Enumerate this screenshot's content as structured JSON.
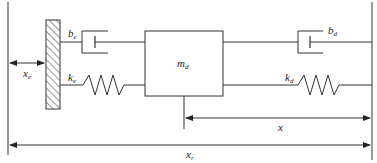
{
  "diagram": {
    "type": "mass-spring-damper",
    "colors": {
      "line": "#333333",
      "background": "#ffffff"
    },
    "mass": {
      "symbol": "m",
      "sub": "d"
    },
    "left_damper": {
      "symbol": "b",
      "sub": "e"
    },
    "left_spring": {
      "symbol": "k",
      "sub": "e"
    },
    "right_damper": {
      "symbol": "b",
      "sub": "d"
    },
    "right_spring": {
      "symbol": "k",
      "sub": "d"
    },
    "wall_offset": {
      "symbol": "x",
      "sub": "e"
    },
    "mass_position": {
      "symbol": "x",
      "sub": ""
    },
    "reference_distance": {
      "symbol": "x",
      "sub": "r"
    }
  }
}
